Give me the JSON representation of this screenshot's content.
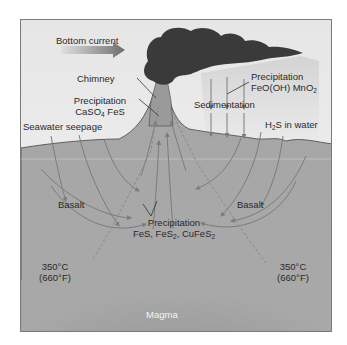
{
  "diagram": {
    "type": "hydrothermal-vent-cross-section",
    "colors": {
      "seawater": "#ececec",
      "crust": "#a9a9a9",
      "plume": "#3a3a3a",
      "magma_core": "#6e6e6e",
      "arrow": "#7c7c7c",
      "text": "#2a2a2a"
    },
    "labels": {
      "bottom_current": "Bottom current",
      "chimney": "Chimney",
      "precip_chimney_title": "Precipitation",
      "precip_chimney_minerals": "CaSO4 FeS",
      "precip_plume_title": "Precipitation",
      "precip_plume_minerals": "FeO(OH) MnO2",
      "sedimentation": "Sedimentation",
      "seawater_seepage": "Seawater seepage",
      "h2s": "H2S in water",
      "basalt_left": "Basalt",
      "basalt_right": "Basalt",
      "precip_deep_title": "Precipitation",
      "precip_deep_minerals": "FeS, FeS2, CuFeS2",
      "temp_left_c": "350°C",
      "temp_left_f": "(660°F)",
      "temp_right_c": "350°C",
      "temp_right_f": "(660°F)",
      "magma": "Magma"
    }
  }
}
